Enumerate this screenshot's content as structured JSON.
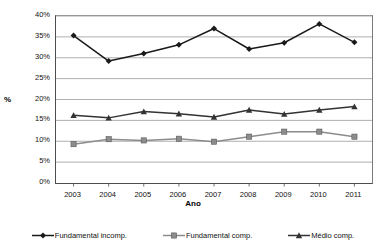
{
  "chart_data": {
    "type": "line",
    "title": "",
    "subtitle": "",
    "xlabel": "Ano",
    "ylabel": "%",
    "categories": [
      "2003",
      "2004",
      "2005",
      "2006",
      "2007",
      "2008",
      "2009",
      "2010",
      "2011"
    ],
    "ylim": [
      0,
      40
    ],
    "ytick_labels": [
      "0%",
      "5%",
      "10%",
      "15%",
      "20%",
      "25%",
      "30%",
      "35%",
      "40%"
    ],
    "ytick_values": [
      0,
      5,
      10,
      15,
      20,
      25,
      30,
      35,
      40
    ],
    "grid": "horizontal",
    "legend_position": "bottom",
    "series": [
      {
        "name": "Fundamental incomp.",
        "marker": "diamond",
        "color": "#1a1a1a",
        "values": [
          35.3,
          29.2,
          31.0,
          33.1,
          37.0,
          32.1,
          33.6,
          38.1,
          33.7
        ]
      },
      {
        "name": "Fundamental comp.",
        "marker": "square",
        "color": "#8c8c8c",
        "values": [
          9.3,
          10.5,
          10.2,
          10.6,
          9.9,
          11.1,
          12.3,
          12.3,
          11.1
        ]
      },
      {
        "name": "Médio comp.",
        "marker": "triangle",
        "color": "#333333",
        "values": [
          16.2,
          15.6,
          17.1,
          16.6,
          15.8,
          17.5,
          16.5,
          17.5,
          18.3
        ]
      }
    ]
  },
  "axes": {
    "y_title": "%",
    "x_title": "Ano"
  },
  "legend": {
    "items": [
      {
        "label": "Fundamental incomp."
      },
      {
        "label": "Fundamental comp."
      },
      {
        "label": "Médio comp."
      }
    ]
  },
  "colors": {
    "grid": "#a6a6a6",
    "axis": "#4d4d4d",
    "series_dark": "#1a1a1a",
    "series_gray": "#8c8c8c",
    "series_mid": "#333333",
    "background": "#ffffff"
  }
}
